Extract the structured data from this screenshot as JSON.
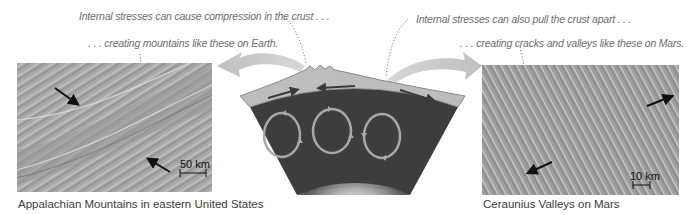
{
  "callouts": {
    "compression": "Internal stresses can cause compression in the crust . . .",
    "mountains": ". . . creating mountains like these on Earth.",
    "pull_apart": "Internal stresses can also pull the crust apart . . .",
    "cracks": ". . . creating cracks and valleys like these on Mars."
  },
  "left_photo": {
    "caption": "Appalachian Mountains in eastern United States",
    "scale_bar": "50 km"
  },
  "right_photo": {
    "caption": "Ceraunius Valleys on Mars",
    "scale_bar": "10 km"
  },
  "diagram": {
    "colors": {
      "crust": "#bdbdbd",
      "crust_edge": "#8a8a8a",
      "mantle": "#3d3d3d",
      "convection_arrow": "#a9a9a9",
      "big_arrow": "#c8c8c8",
      "photo_earth": "#a7a7a7",
      "photo_mars": "#9a9a9a"
    }
  }
}
